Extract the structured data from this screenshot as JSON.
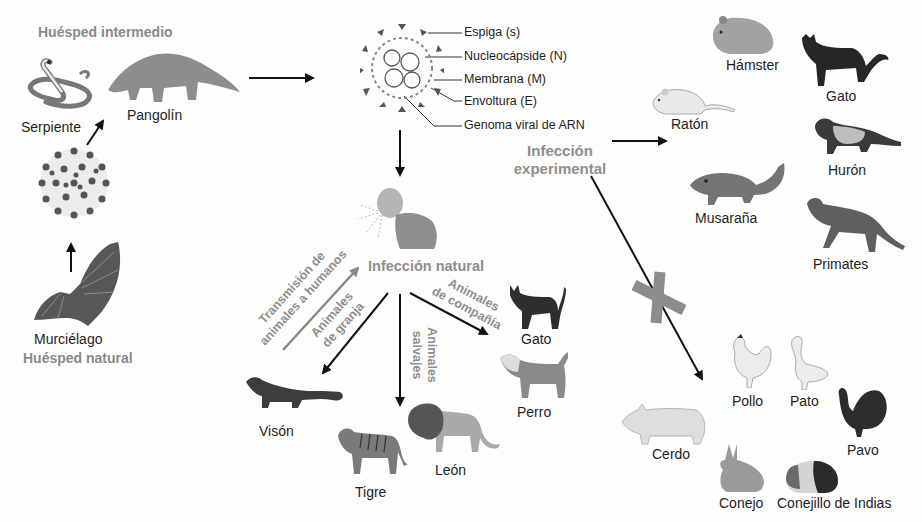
{
  "diagram": {
    "hosts": {
      "intermediate_title": "Huésped intermedio",
      "natural_title": "Huésped natural",
      "snake": "Serpiente",
      "pangolin": "Pangolín",
      "bat": "Murciélago"
    },
    "virus_structure": {
      "labels": [
        "Espiga (s)",
        "Nucleocápside (N)",
        "Membrana (M)",
        "Envoltura (E)",
        "Genoma viral de ARN"
      ]
    },
    "natural_infection": {
      "title": "Infección natural",
      "zoonosis_label_line1": "Transmisión de",
      "zoonosis_label_line2": "animales a humanos",
      "farm_label_line1": "Animales",
      "farm_label_line2": "de granja",
      "wild_label_line1": "Animales",
      "wild_label_line2": "salvajes",
      "pets_label_line1": "Animales",
      "pets_label_line2": "de compañía",
      "farm_animals": [
        "Visón"
      ],
      "wild_animals": [
        "Tigre",
        "León"
      ],
      "pet_animals": [
        "Gato",
        "Perro"
      ]
    },
    "experimental_infection": {
      "title_line1": "Infección",
      "title_line2": "experimental",
      "susceptible": [
        "Hámster",
        "Gato",
        "Ratón",
        "Hurón",
        "Musaraña",
        "Primates"
      ],
      "not_susceptible": [
        "Pollo",
        "Pato",
        "Cerdo",
        "Pavo",
        "Conejo",
        "Conejillo de Indias"
      ]
    },
    "colors": {
      "arrow": "#111111",
      "gray_label": "#8a8a8a",
      "x_mark": "#8c8c8c"
    }
  }
}
